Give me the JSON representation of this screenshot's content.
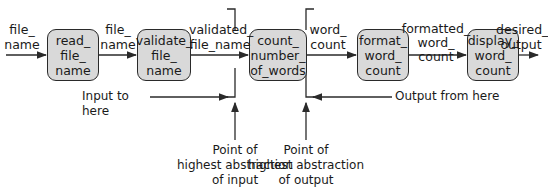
{
  "flow": {
    "boxes": [
      {
        "id": "read_file_name",
        "label": "read_\nfile_\nname"
      },
      {
        "id": "validate_file_name",
        "label": "validate_\nfile_\nname"
      },
      {
        "id": "count_number_of_words",
        "label": "count_\nnumber_\nof_words"
      },
      {
        "id": "format_word_count",
        "label": "format_\nword_\ncount"
      },
      {
        "id": "display_word_count",
        "label": "display_\nword_\ncount"
      }
    ],
    "edges": [
      {
        "label": "file_\nname"
      },
      {
        "label": "file_\nname"
      },
      {
        "label": "validated_\nfile_name"
      },
      {
        "label": "word_\ncount"
      },
      {
        "label": "formatted_\nword_\ncount"
      },
      {
        "label": "desired_\noutput"
      }
    ]
  },
  "annotations": {
    "input_to_here": "Input to here",
    "output_from_here": "Output from here",
    "highest_abstraction_input": "Point of\nhighest abstraction\nof input",
    "highest_abstraction_output": "Point of\nhighest abstraction\nof output"
  }
}
